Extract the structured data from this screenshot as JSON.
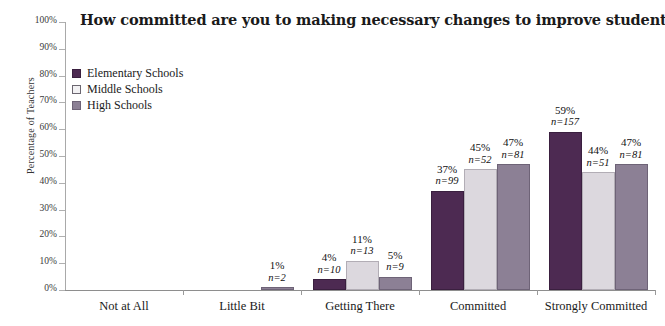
{
  "chart_data": {
    "type": "bar",
    "title": "How committed are you to making necessary changes to improve student learning?",
    "xlabel": "",
    "ylabel": "Percentage of Teachers",
    "ylim": [
      0,
      100
    ],
    "ytick_labels": [
      "0%",
      "10%",
      "20%",
      "30%",
      "40%",
      "50%",
      "60%",
      "70%",
      "80%",
      "90%",
      "100%"
    ],
    "ytick_values": [
      0,
      10,
      20,
      30,
      40,
      50,
      60,
      70,
      80,
      90,
      100
    ],
    "grid": false,
    "legend_position": "upper-left-inside",
    "categories": [
      "Not at All",
      "Little Bit",
      "Getting There",
      "Committed",
      "Strongly Committed"
    ],
    "series": [
      {
        "name": "Elementary Schools",
        "color": "#4d2a52",
        "values": [
          0,
          0,
          4,
          37,
          59
        ],
        "counts": [
          null,
          null,
          10,
          99,
          157
        ],
        "labels": [
          "",
          "",
          "4%",
          "37%",
          "59%"
        ],
        "count_labels": [
          "",
          "",
          "n=10",
          "n=99",
          "n=157"
        ]
      },
      {
        "name": "Middle Schools",
        "color": "#dcd8de",
        "values": [
          0,
          0,
          11,
          45,
          44
        ],
        "counts": [
          null,
          null,
          13,
          52,
          51
        ],
        "labels": [
          "",
          "",
          "11%",
          "45%",
          "44%"
        ],
        "count_labels": [
          "",
          "",
          "n=13",
          "n=52",
          "n=51"
        ]
      },
      {
        "name": "High Schools",
        "color": "#8c8095",
        "values": [
          0,
          1,
          5,
          47,
          47
        ],
        "counts": [
          null,
          2,
          9,
          81,
          81
        ],
        "labels": [
          "",
          "1%",
          "5%",
          "47%",
          "47%"
        ],
        "count_labels": [
          "",
          "n=2",
          "n=9",
          "n=81",
          "n=81"
        ]
      }
    ]
  },
  "legend": {
    "items": [
      {
        "label": "Elementary Schools"
      },
      {
        "label": "Middle Schools"
      },
      {
        "label": "High Schools"
      }
    ]
  }
}
